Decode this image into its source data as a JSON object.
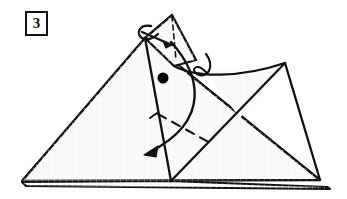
{
  "figure": {
    "kind": "origami-fold-diagram",
    "step_number": "3",
    "background_color": "#ffffff",
    "paper_fill": "#fbfbfb",
    "paper_fill_shaded": "#f4f4f4",
    "line_color": "#111111",
    "dot_color": "#000000",
    "grid_color": "#f0f0f0"
  },
  "labels": {
    "step_badge": "3"
  },
  "geometry": {
    "outer_triangle": {
      "name": "large-base-triangle",
      "points": "22,181 145,38 320,180"
    },
    "bottom_layer": {
      "name": "lower-paper-layer",
      "points": "22,182 170,181 327,187 330,189 26,186"
    },
    "apex_flap": {
      "name": "apex-flap",
      "points": "145,38 172,15 196,60 174,66"
    },
    "right_flap": {
      "name": "right-point-flap",
      "points": "285,63 206,72 240,118"
    },
    "center_panel": {
      "name": "center-panel",
      "points": "145,38 174,66 206,72 171,181"
    },
    "fold_lines": [
      {
        "name": "center-vertical-fold",
        "d": "M145,38 L171,181"
      },
      {
        "name": "right-diagonal-fold",
        "d": "M285,63 L171,181"
      },
      {
        "name": "right-point-edge",
        "d": "M285,63 L320,180"
      }
    ],
    "dashed_lines": [
      {
        "name": "apex-valley-fold-dashed",
        "d": "M172,16 L176,60"
      },
      {
        "name": "lower-valley-fold-dashed",
        "d": "M158,114 L212,144"
      }
    ],
    "curves": [
      {
        "name": "upper-swoop-curve",
        "d": "M174,66 C196,78 240,78 285,63"
      },
      {
        "name": "cusp-loop-curve",
        "d": "M206,54 C215,66 208,80 197,74 C190,70 196,62 206,72"
      },
      {
        "name": "lower-sweep-curve",
        "d": "M171,42 C200,74 212,120 150,152"
      }
    ],
    "arrows": [
      {
        "name": "curl-arrow-apex",
        "curl_d": "M151,26 C140,24 135,33 142,38 C147,41 154,38 158,34",
        "shaft_d": "M142,32 C152,36 162,41 172,45",
        "head_points": "172,45 163,41 166,48"
      },
      {
        "name": "big-fold-arrow",
        "shaft_d": "M171,42 C200,74 212,120 150,152",
        "head_points": "144,155 158,146 156,157"
      },
      {
        "name": "valley-tick-upper",
        "d": "M150,118 L157,113"
      }
    ],
    "dot": {
      "name": "reference-dot",
      "cx": 163,
      "cy": 78,
      "r": 5.5
    }
  }
}
